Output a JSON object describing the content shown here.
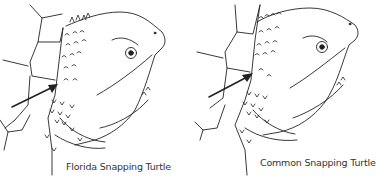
{
  "figure": {
    "panels": [
      {
        "id": "florida",
        "caption": "Florida Snapping Turtle",
        "feature": "arrow pointing to neck tubercles"
      },
      {
        "id": "common",
        "caption": "Common Snapping Turtle",
        "feature": "arrow pointing to neck tubercles"
      }
    ],
    "colors": {
      "line": "#222222",
      "background": "#ffffff",
      "text": "#333333"
    }
  }
}
